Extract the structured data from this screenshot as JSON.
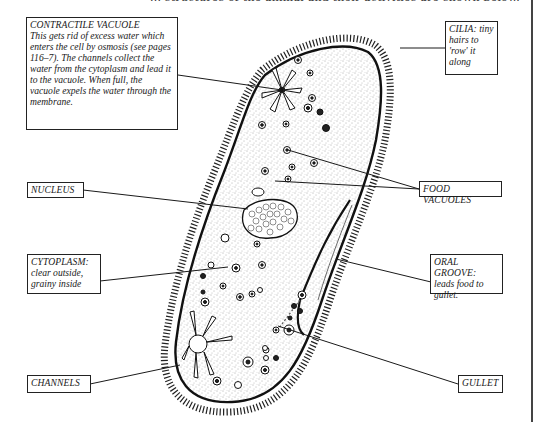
{
  "diagram": {
    "header_fragment": "... structures of the animal and their activities are shown below.",
    "labels": [
      {
        "id": "contractile-vacuole",
        "title": "CONTRACTILE VACUOLE",
        "text": "This gets rid of excess water which enters the cell by osmosis (see pages 116–7). The channels collect the water from the cytoplasm and lead it to the vacuole. When full, the vacuole expels the water through the membrane."
      },
      {
        "id": "cilia",
        "title": "CILIA:",
        "text": "tiny hairs to 'row' it along"
      },
      {
        "id": "nucleus",
        "title": "NUCLEUS",
        "text": ""
      },
      {
        "id": "food-vacuoles",
        "title": "FOOD VACUOLES",
        "text": ""
      },
      {
        "id": "cytoplasm",
        "title": "CYTOPLASM:",
        "text": "clear outside, grainy inside"
      },
      {
        "id": "oral-groove",
        "title": "ORAL GROOVE:",
        "text": "leads food to gullet."
      },
      {
        "id": "channels",
        "title": "CHANNELS",
        "text": ""
      },
      {
        "id": "gullet",
        "title": "GULLET",
        "text": ""
      }
    ],
    "colors": {
      "ink": "#1a1a1a",
      "paper": "#ffffff",
      "stipple": "#555555"
    }
  }
}
